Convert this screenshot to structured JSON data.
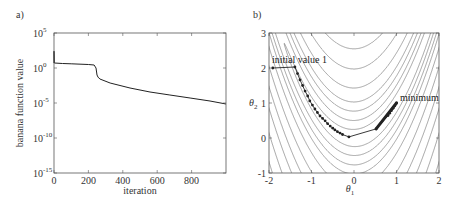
{
  "chart_data": [
    {
      "panel": "a)",
      "type": "line",
      "title": "",
      "xlabel": "iteration",
      "ylabel": "banana function value",
      "xscale": "linear",
      "yscale": "log",
      "xlim": [
        0,
        1000
      ],
      "ylim_log10": [
        -15,
        5
      ],
      "xticks": [
        0,
        200,
        400,
        600,
        800
      ],
      "yticks": [
        {
          "base": "10",
          "exp": "5",
          "log10": 5
        },
        {
          "base": "10",
          "exp": "0",
          "log10": 0
        },
        {
          "base": "10",
          "exp": "-5",
          "log10": -5
        },
        {
          "base": "10",
          "exp": "-10",
          "log10": -10
        },
        {
          "base": "10",
          "exp": "-15",
          "log10": -15
        }
      ],
      "grid": false,
      "series": [
        {
          "name": "banana function value",
          "x": [
            0,
            0,
            2,
            50,
            100,
            200,
            233,
            244,
            250,
            256,
            267,
            326,
            442,
            558,
            674,
            791,
            907,
            1000
          ],
          "log10_y": [
            0.7,
            2.4,
            0.71,
            0.65,
            0.6,
            0.5,
            0.43,
            0.0,
            -1.0,
            -1.3,
            -1.57,
            -2.14,
            -2.86,
            -3.43,
            -3.86,
            -4.29,
            -4.71,
            -5.14
          ]
        }
      ]
    },
    {
      "panel": "b)",
      "type": "line",
      "subtype": "contour with optimization path",
      "title": "",
      "xlabel": "θ1",
      "ylabel": "θ2",
      "xlim": [
        -2,
        2
      ],
      "ylim": [
        -1,
        3
      ],
      "xticks": [
        -2,
        -1,
        0,
        1,
        2
      ],
      "yticks": [
        -1,
        0,
        1,
        2,
        3
      ],
      "grid": false,
      "contour_function": "(1-θ1)^2 + 100(θ2-θ1^2)^2",
      "contour_levels": [
        7,
        26,
        60,
        107,
        205,
        390,
        650,
        1000,
        1500,
        2200,
        3100
      ],
      "series": [
        {
          "name": "optimization path",
          "theta1": [
            -1.91,
            -1.39,
            -1.33,
            -1.27,
            -1.21,
            -1.15,
            -1.09,
            -1.04,
            -0.98,
            -0.92,
            -0.86,
            -0.8,
            -0.74,
            -0.68,
            -0.62,
            -0.56,
            -0.5,
            -0.45,
            -0.39,
            -0.33,
            -0.27,
            -0.12,
            0.52,
            0.8,
            0.84,
            0.88,
            0.92,
            0.96,
            1.0
          ],
          "theta2": [
            2.0,
            2.03,
            1.84,
            1.66,
            1.5,
            1.34,
            1.2,
            1.06,
            0.94,
            0.83,
            0.73,
            0.63,
            0.56,
            0.49,
            0.41,
            0.34,
            0.28,
            0.23,
            0.18,
            0.14,
            0.1,
            0.03,
            0.26,
            0.64,
            0.71,
            0.78,
            0.85,
            0.92,
            1.0
          ]
        }
      ],
      "annotations": [
        {
          "text": "initial value 1",
          "at": [
            -1.91,
            2.0
          ]
        },
        {
          "text": "minimum",
          "at": [
            1.0,
            1.0
          ]
        }
      ]
    }
  ],
  "labels": {
    "panel_a": "a)",
    "panel_b": "b)",
    "a_ylabel": "banana function value",
    "a_xlabel": "iteration",
    "b_xlabel_sym": "θ",
    "b_xlabel_sub": "1",
    "b_ylabel_sym": "θ",
    "b_ylabel_sub": "2",
    "annot_initial": "initial value 1",
    "annot_minimum": "minimum"
  },
  "colors": {
    "line": "#222222",
    "contour": "#666666",
    "axis": "#555555",
    "marker": "#222222"
  }
}
